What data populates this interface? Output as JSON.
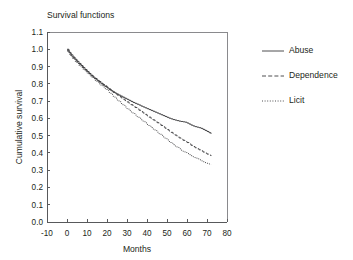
{
  "chart_data": {
    "type": "line",
    "title": "Survival functions",
    "xlabel": "Months",
    "ylabel": "Cumulative survival",
    "xlim": [
      -10,
      80
    ],
    "ylim": [
      0.0,
      1.1
    ],
    "grid": false,
    "legend_position": "right",
    "xticks": [
      "-10",
      "0",
      "10",
      "20",
      "30",
      "40",
      "50",
      "60",
      "70",
      "80"
    ],
    "xtick_values": [
      -10,
      0,
      10,
      20,
      30,
      40,
      50,
      60,
      70,
      80
    ],
    "yticks": [
      "0.0",
      "0.1",
      "0.2",
      "0.3",
      "0.4",
      "0.5",
      "0.6",
      "0.7",
      "0.8",
      "0.9",
      "1.0",
      "1.1"
    ],
    "ytick_values": [
      0.0,
      0.1,
      0.2,
      0.3,
      0.4,
      0.5,
      0.6,
      0.7,
      0.8,
      0.9,
      1.0,
      1.1
    ],
    "series": [
      {
        "name": "Abuse",
        "linestyle": "solid",
        "color": "#3b3b3d",
        "x": [
          0,
          1,
          2,
          3,
          4,
          5,
          6,
          7,
          8,
          9,
          10,
          11,
          12,
          13,
          14,
          15,
          16,
          17,
          18,
          19,
          20,
          21,
          22,
          23,
          24,
          25,
          26,
          27,
          28,
          29,
          30,
          31,
          32,
          33,
          34,
          35,
          36,
          37,
          38,
          39,
          40,
          41,
          42,
          43,
          44,
          45,
          46,
          47,
          48,
          49,
          50,
          51,
          52,
          53,
          54,
          55,
          56,
          57,
          58,
          59,
          60,
          61,
          62,
          63,
          64,
          65,
          66,
          67,
          68,
          69,
          70,
          71,
          72
        ],
        "y": [
          1.0,
          0.982,
          0.968,
          0.955,
          0.942,
          0.93,
          0.918,
          0.906,
          0.894,
          0.882,
          0.871,
          0.86,
          0.849,
          0.839,
          0.829,
          0.82,
          0.81,
          0.801,
          0.792,
          0.784,
          0.776,
          0.768,
          0.76,
          0.753,
          0.746,
          0.74,
          0.734,
          0.728,
          0.722,
          0.716,
          0.71,
          0.704,
          0.698,
          0.692,
          0.687,
          0.682,
          0.677,
          0.671,
          0.666,
          0.661,
          0.656,
          0.651,
          0.646,
          0.641,
          0.636,
          0.631,
          0.626,
          0.621,
          0.616,
          0.611,
          0.606,
          0.601,
          0.597,
          0.593,
          0.59,
          0.587,
          0.584,
          0.582,
          0.58,
          0.578,
          0.573,
          0.567,
          0.561,
          0.556,
          0.552,
          0.549,
          0.546,
          0.542,
          0.536,
          0.53,
          0.524,
          0.517,
          0.51
        ]
      },
      {
        "name": "Dependence",
        "linestyle": "dashed",
        "color": "#3b3b3d",
        "x": [
          0,
          1,
          2,
          3,
          4,
          5,
          6,
          7,
          8,
          9,
          10,
          11,
          12,
          13,
          14,
          15,
          16,
          17,
          18,
          19,
          20,
          21,
          22,
          23,
          24,
          25,
          26,
          27,
          28,
          29,
          30,
          31,
          32,
          33,
          34,
          35,
          36,
          37,
          38,
          39,
          40,
          41,
          42,
          43,
          44,
          45,
          46,
          47,
          48,
          49,
          50,
          51,
          52,
          53,
          54,
          55,
          56,
          57,
          58,
          59,
          60,
          61,
          62,
          63,
          64,
          65,
          66,
          67,
          68,
          69,
          70,
          71,
          72
        ],
        "y": [
          0.995,
          0.978,
          0.963,
          0.95,
          0.937,
          0.925,
          0.914,
          0.903,
          0.892,
          0.881,
          0.87,
          0.859,
          0.849,
          0.84,
          0.831,
          0.822,
          0.813,
          0.804,
          0.796,
          0.788,
          0.78,
          0.77,
          0.76,
          0.751,
          0.743,
          0.735,
          0.727,
          0.719,
          0.711,
          0.703,
          0.695,
          0.687,
          0.679,
          0.671,
          0.663,
          0.655,
          0.647,
          0.639,
          0.631,
          0.623,
          0.615,
          0.607,
          0.599,
          0.591,
          0.583,
          0.575,
          0.567,
          0.559,
          0.551,
          0.543,
          0.535,
          0.527,
          0.519,
          0.511,
          0.503,
          0.495,
          0.487,
          0.48,
          0.473,
          0.466,
          0.46,
          0.452,
          0.444,
          0.437,
          0.43,
          0.424,
          0.418,
          0.412,
          0.405,
          0.399,
          0.393,
          0.387,
          0.382
        ]
      },
      {
        "name": "Licit",
        "linestyle": "dotted",
        "color": "#3b3b3d",
        "x": [
          0,
          1,
          2,
          3,
          4,
          5,
          6,
          7,
          8,
          9,
          10,
          11,
          12,
          13,
          14,
          15,
          16,
          17,
          18,
          19,
          20,
          21,
          22,
          23,
          24,
          25,
          26,
          27,
          28,
          29,
          30,
          31,
          32,
          33,
          34,
          35,
          36,
          37,
          38,
          39,
          40,
          41,
          42,
          43,
          44,
          45,
          46,
          47,
          48,
          49,
          50,
          51,
          52,
          53,
          54,
          55,
          56,
          57,
          58,
          59,
          60,
          61,
          62,
          63,
          64,
          65,
          66,
          67,
          68,
          69,
          70,
          71,
          72
        ],
        "y": [
          0.99,
          0.972,
          0.957,
          0.943,
          0.93,
          0.918,
          0.906,
          0.895,
          0.884,
          0.873,
          0.862,
          0.851,
          0.84,
          0.83,
          0.82,
          0.81,
          0.8,
          0.79,
          0.781,
          0.772,
          0.762,
          0.75,
          0.739,
          0.728,
          0.717,
          0.706,
          0.696,
          0.686,
          0.676,
          0.666,
          0.656,
          0.646,
          0.637,
          0.628,
          0.619,
          0.61,
          0.601,
          0.592,
          0.583,
          0.574,
          0.565,
          0.556,
          0.547,
          0.538,
          0.529,
          0.52,
          0.511,
          0.502,
          0.493,
          0.484,
          0.475,
          0.466,
          0.457,
          0.448,
          0.44,
          0.432,
          0.424,
          0.416,
          0.409,
          0.402,
          0.396,
          0.39,
          0.384,
          0.378,
          0.372,
          0.366,
          0.36,
          0.354,
          0.349,
          0.344,
          0.34,
          0.336,
          0.333
        ]
      }
    ]
  },
  "legend": {
    "items": [
      {
        "label": "Abuse"
      },
      {
        "label": "Dependence"
      },
      {
        "label": "Licit"
      }
    ]
  }
}
